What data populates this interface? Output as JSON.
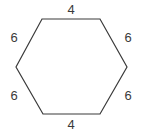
{
  "figure": {
    "shape_name": "hexagon",
    "stroke_color": "#3a3a3a",
    "fill_color": "#ffffff",
    "background_color": "#ffffff",
    "label_color": "#3a3a3a",
    "vertices": [
      [
        42,
        19
      ],
      [
        100,
        19
      ],
      [
        127,
        67
      ],
      [
        100,
        114
      ],
      [
        43,
        114
      ],
      [
        16,
        67
      ]
    ],
    "labels": {
      "top": "4",
      "upper_right": "6",
      "lower_right": "6",
      "bottom": "4",
      "lower_left": "6",
      "upper_left": "6"
    }
  },
  "chart_data": {
    "type": "diagram",
    "title": "",
    "shape": "hexagon",
    "sides": 6,
    "side_lengths": [
      4,
      6,
      6,
      4,
      6,
      6
    ],
    "side_labels": [
      "4",
      "6",
      "6",
      "4",
      "6",
      "6"
    ],
    "side_order": [
      "top",
      "upper-right",
      "lower-right",
      "bottom",
      "lower-left",
      "upper-left"
    ],
    "units": "",
    "perimeter": 32
  }
}
